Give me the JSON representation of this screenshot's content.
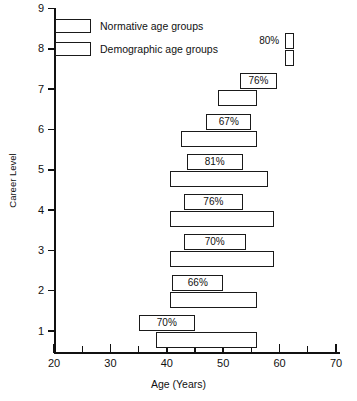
{
  "chart_data": {
    "type": "bar",
    "title": "",
    "xlabel": "Age (Years)",
    "ylabel": "Career Level",
    "xlim": [
      18,
      71
    ],
    "ylim": [
      0,
      9
    ],
    "grid": false,
    "legend_position": "top-left",
    "x_major_ticks": [
      20,
      30,
      40,
      50,
      60,
      70
    ],
    "x_minor_ticks": [
      25,
      35,
      45,
      55,
      65
    ],
    "y_ticks": [
      1,
      2,
      3,
      4,
      5,
      6,
      7,
      8,
      9
    ],
    "legend": [
      {
        "name": "Normative age groups",
        "key": "normative"
      },
      {
        "name": "Demographic age groups",
        "key": "demographic"
      }
    ],
    "series": [
      {
        "name": "Normative age groups",
        "key": "normative",
        "note": "upper bar of each pair; percentage label printed in or beside it",
        "bars": [
          {
            "level": 8,
            "start": 61.0,
            "end": 62.5,
            "percent": "80%",
            "label_position": "outside-left"
          },
          {
            "level": 7,
            "start": 53.0,
            "end": 59.5,
            "percent": "76%",
            "label_position": "inside"
          },
          {
            "level": 6,
            "start": 47.0,
            "end": 55.0,
            "percent": "67%",
            "label_position": "inside"
          },
          {
            "level": 5,
            "start": 43.5,
            "end": 53.5,
            "percent": "81%",
            "label_position": "inside"
          },
          {
            "level": 4,
            "start": 43.0,
            "end": 53.5,
            "percent": "76%",
            "label_position": "inside"
          },
          {
            "level": 3,
            "start": 43.0,
            "end": 54.0,
            "percent": "70%",
            "label_position": "inside"
          },
          {
            "level": 2,
            "start": 41.0,
            "end": 50.0,
            "percent": "66%",
            "label_position": "inside"
          },
          {
            "level": 1,
            "start": 35.0,
            "end": 45.0,
            "percent": "70%",
            "label_position": "inside"
          }
        ]
      },
      {
        "name": "Demographic age groups",
        "key": "demographic",
        "note": "lower bar of each pair; no percentage label",
        "bars": [
          {
            "level": 8,
            "start": 61.0,
            "end": 62.5,
            "percent": ""
          },
          {
            "level": 7,
            "start": 49.0,
            "end": 56.0,
            "percent": ""
          },
          {
            "level": 6,
            "start": 42.5,
            "end": 56.0,
            "percent": ""
          },
          {
            "level": 5,
            "start": 40.5,
            "end": 58.0,
            "percent": ""
          },
          {
            "level": 4,
            "start": 40.5,
            "end": 59.0,
            "percent": ""
          },
          {
            "level": 3,
            "start": 40.5,
            "end": 59.0,
            "percent": ""
          },
          {
            "level": 2,
            "start": 40.5,
            "end": 56.0,
            "percent": ""
          },
          {
            "level": 1,
            "start": 38.0,
            "end": 56.0,
            "percent": ""
          }
        ]
      }
    ],
    "value_labels": [
      "80%",
      "76%",
      "67%",
      "81%",
      "76%",
      "70%",
      "66%",
      "70%"
    ]
  }
}
